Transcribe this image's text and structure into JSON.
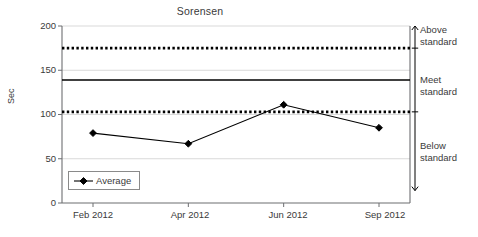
{
  "chart_data": {
    "type": "line",
    "title": "Sorensen",
    "xlabel": "",
    "ylabel": "Sec",
    "ylim": [
      0,
      200
    ],
    "yticks": [
      0,
      50,
      100,
      150,
      200
    ],
    "grid": true,
    "legend_position": "lower-left",
    "categories": [
      "Feb 2012",
      "Apr 2012",
      "Jun 2012",
      "Sep 2012"
    ],
    "series": [
      {
        "name": "Average",
        "values": [
          79,
          67,
          111,
          85
        ],
        "marker": "diamond",
        "color": "#000000"
      }
    ],
    "reference_lines": [
      {
        "name": "upper-control-line",
        "value": 175,
        "style": "dotted",
        "color": "#000000"
      },
      {
        "name": "target-line",
        "value": 139,
        "style": "solid",
        "color": "#000000"
      },
      {
        "name": "lower-control-line",
        "value": 103,
        "style": "dotted",
        "color": "#000000"
      }
    ],
    "zones": [
      {
        "label_line1": "Above",
        "label_line2": "standard",
        "from": 175,
        "to": 200
      },
      {
        "label_line1": "Meet",
        "label_line2": "standard",
        "from": 103,
        "to": 175
      },
      {
        "label_line1": "Below",
        "label_line2": "standard",
        "from": 14,
        "to": 103
      }
    ]
  },
  "title": "Sorensen",
  "axes": {
    "y_title": "Sec",
    "y_tick_200": "200",
    "y_tick_150": "150",
    "y_tick_100": "100",
    "y_tick_50": "50",
    "y_tick_0": "0",
    "x_tick_1": "Feb 2012",
    "x_tick_2": "Apr 2012",
    "x_tick_3": "Jun 2012",
    "x_tick_4": "Sep 2012"
  },
  "legend": {
    "series_label": "Average"
  },
  "zone_labels": {
    "above_1": "Above",
    "above_2": "standard",
    "meet_1": "Meet",
    "meet_2": "standard",
    "below_1": "Below",
    "below_2": "standard"
  },
  "colors": {
    "axis": "#6d6e71",
    "grid": "#d9d9d9",
    "series": "#000000",
    "text": "#3a3a3a"
  }
}
